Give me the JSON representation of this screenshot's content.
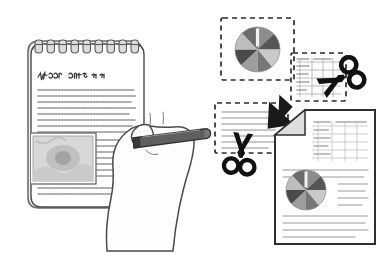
{
  "scene": {
    "title": "Clipping content from a notepad into a compiled document",
    "background_color": "#ffffff",
    "width": 391,
    "height": 277
  },
  "palette": {
    "outline": "#3a3a3a",
    "soft_outline": "#6e6e6e",
    "paper_white": "#ffffff",
    "paper_shade": "#e8e8e8",
    "pie_dark": "#555555",
    "pie_mid": "#8c8c8c",
    "pie_light": "#c9c9c9",
    "pencil_body": "#5a5a5a",
    "pencil_dark": "#3f3f3f",
    "arrow_black": "#1a1a1a",
    "scissors_black": "#111111",
    "dashed_stroke": "#2b2b2b",
    "text_line": "#b9b9b9",
    "photo_fill": "#d5d5d5",
    "photo_blob": "#a8a8a8",
    "skin_fill": "#fdfdfd"
  },
  "notepad": {
    "name": "spiral-notepad",
    "rings_count": 9,
    "handwritten_title": "ℓ/cto  uert  er  er",
    "handwritten_title_note": "illegible decorative handwriting",
    "body_lines_count": 11,
    "body_text_note": "illegible decorative handwriting lines",
    "embedded_photo": {
      "name": "embedded-photo",
      "caption": ""
    }
  },
  "hand": {
    "name": "hand-holding-stylus",
    "stylus_label": "stylus"
  },
  "clips": [
    {
      "id": "clip-pie",
      "name": "dashed-selection-pie",
      "kind": "pie",
      "label": ""
    },
    {
      "id": "clip-table",
      "name": "dashed-selection-table",
      "kind": "table",
      "label": ""
    },
    {
      "id": "clip-text",
      "name": "dashed-selection-text",
      "kind": "text",
      "label": "",
      "lines_count": 7
    }
  ],
  "scissors": [
    {
      "id": "scissors-right",
      "name": "scissors-icon-right",
      "rotation_deg": -28
    },
    {
      "id": "scissors-left",
      "name": "scissors-icon-left",
      "rotation_deg": 8
    }
  ],
  "arrow": {
    "name": "paste-arrow-icon",
    "direction": "down-right"
  },
  "result_document": {
    "name": "result-document",
    "folded_corner": true,
    "text_lines_count": 11,
    "embedded_table": {
      "name": "document-table",
      "rows": 5,
      "cols": 5
    },
    "embedded_pie": {
      "name": "document-pie-chart"
    }
  },
  "chart_data": {
    "type": "pie",
    "title": "",
    "categories": [
      "A",
      "B",
      "C",
      "D",
      "E",
      "F",
      "G",
      "H"
    ],
    "values": [
      13,
      12,
      14,
      11,
      13,
      12,
      13,
      12
    ],
    "colors": [
      "#8c8c8c",
      "#555555",
      "#c9c9c9",
      "#777777",
      "#9d9d9d",
      "#4a4a4a",
      "#bdbdbd",
      "#6b6b6b"
    ],
    "legend": "none",
    "xlabel": "",
    "ylabel": ""
  }
}
